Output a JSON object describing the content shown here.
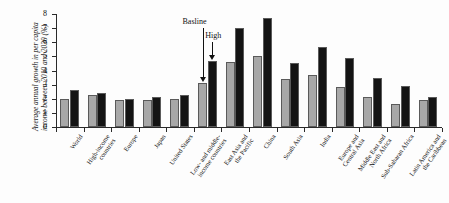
{
  "chart_data": {
    "type": "bar",
    "title": "",
    "xlabel": "",
    "ylabel": "Average annual growth in per capita income between 2010 and 2030 (%)",
    "ylim": [
      0,
      8
    ],
    "ytick_labels": [
      "0",
      "1",
      "2",
      "3",
      "4",
      "5",
      "6",
      "7",
      "8"
    ],
    "grid": false,
    "legend_position": "none",
    "categories": [
      "World",
      "High-income countries",
      "Europe",
      "Japan",
      "United States",
      "Low- and middle-income countries",
      "East Asia and the Pacific",
      "China",
      "South Asia",
      "India",
      "Europe and Central Asia",
      "Middle East and North Africa",
      "Sub-Saharan Africa",
      "Latin America and the Caribbean"
    ],
    "category_lines": [
      [
        "World"
      ],
      [
        "High-income",
        "countries"
      ],
      [
        "Europe"
      ],
      [
        "Japan"
      ],
      [
        "United States"
      ],
      [
        "Low- and middle-",
        "income countries"
      ],
      [
        "East Asia and",
        "the Pacific"
      ],
      [
        "China"
      ],
      [
        "South Asia"
      ],
      [
        "India"
      ],
      [
        "Europe and",
        "Central Asia"
      ],
      [
        "Middle East and",
        "North Africa"
      ],
      [
        "Sub-Saharan Africa"
      ],
      [
        "Latin America and",
        "the Caribbean"
      ]
    ],
    "series": [
      {
        "name": "Basline",
        "color": "#a8a8a8",
        "values": [
          2.0,
          2.3,
          1.9,
          1.9,
          2.0,
          3.1,
          4.6,
          5.0,
          3.4,
          3.7,
          2.8,
          2.1,
          1.6,
          1.9
        ]
      },
      {
        "name": "High",
        "color": "#141414",
        "values": [
          2.6,
          2.4,
          2.0,
          2.1,
          2.3,
          4.7,
          7.0,
          7.7,
          4.5,
          5.7,
          4.9,
          3.5,
          2.9,
          2.1
        ]
      }
    ],
    "annotations": [
      {
        "label": "Basline",
        "target_series": "Basline",
        "target_category": "Low- and middle-income countries"
      },
      {
        "label": "High",
        "target_series": "High",
        "target_category": "Low- and middle-income countries"
      }
    ]
  }
}
